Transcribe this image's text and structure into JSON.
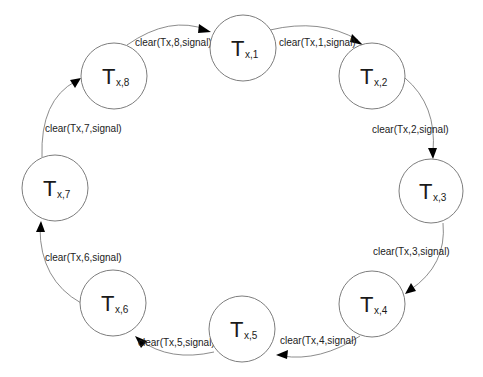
{
  "diagram": {
    "type": "state-cycle",
    "states": [
      {
        "id": "1",
        "main": "T",
        "sub": "x,1"
      },
      {
        "id": "2",
        "main": "T",
        "sub": "x,2"
      },
      {
        "id": "3",
        "main": "T",
        "sub": "x,3"
      },
      {
        "id": "4",
        "main": "T",
        "sub": "x,4"
      },
      {
        "id": "5",
        "main": "T",
        "sub": "x,5"
      },
      {
        "id": "6",
        "main": "T",
        "sub": "x,6"
      },
      {
        "id": "7",
        "main": "T",
        "sub": "x,7"
      },
      {
        "id": "8",
        "main": "T",
        "sub": "x,8"
      }
    ],
    "transitions": [
      {
        "from": "1",
        "to": "2",
        "label": "clear(Tx,1,signal)"
      },
      {
        "from": "2",
        "to": "3",
        "label": "clear(Tx,2,signal)"
      },
      {
        "from": "3",
        "to": "4",
        "label": "clear(Tx,3,signal)"
      },
      {
        "from": "4",
        "to": "5",
        "label": "clear(Tx,4,signal)"
      },
      {
        "from": "5",
        "to": "6",
        "label": "clear(Tx,5,signal)"
      },
      {
        "from": "6",
        "to": "7",
        "label": "clear(Tx,6,signal)"
      },
      {
        "from": "7",
        "to": "8",
        "label": "clear(Tx,7,signal)"
      },
      {
        "from": "8",
        "to": "1",
        "label": "clear(Tx,8,signal)"
      }
    ]
  }
}
